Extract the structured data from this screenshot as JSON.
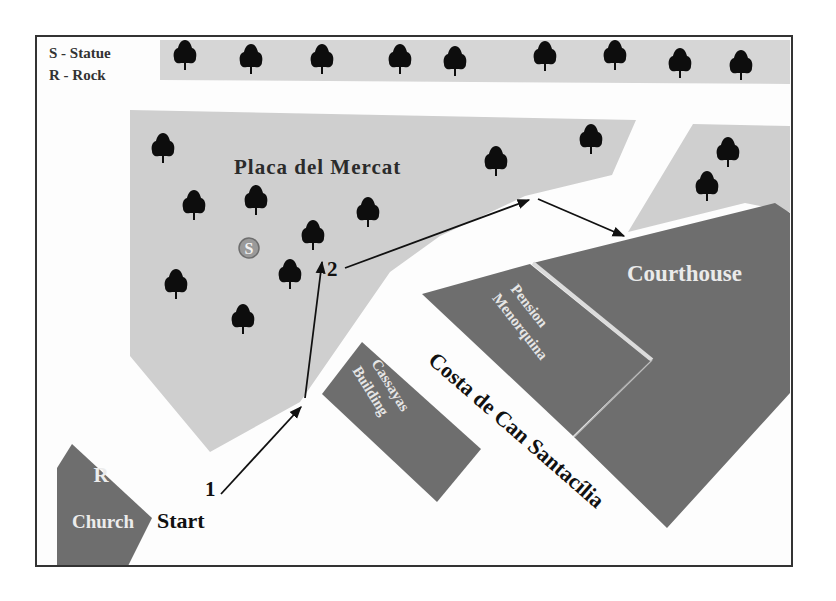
{
  "legend": {
    "items": [
      {
        "key": "S",
        "label": "S - Statue"
      },
      {
        "key": "R",
        "label": "R - Rock"
      }
    ]
  },
  "areas": {
    "plaza": "Placa del Mercat",
    "courthouse": "Courthouse",
    "pension_line1": "Pension",
    "pension_line2": "Menorquina",
    "cassayas_line1": "Cassayas",
    "cassayas_line2": "Building",
    "church": "Church",
    "street": "Costa de Can Santacília"
  },
  "markers": {
    "statue": "S",
    "rock": "R"
  },
  "route": {
    "start": "Start",
    "waypoint1": "1",
    "waypoint2": "2"
  },
  "colors": {
    "plaza_grey": "#cfcfcf",
    "building_dark": "#6e6e6e",
    "tree": "#0d0d0d",
    "frame": "#333333",
    "light_text": "#e8e8e8"
  }
}
